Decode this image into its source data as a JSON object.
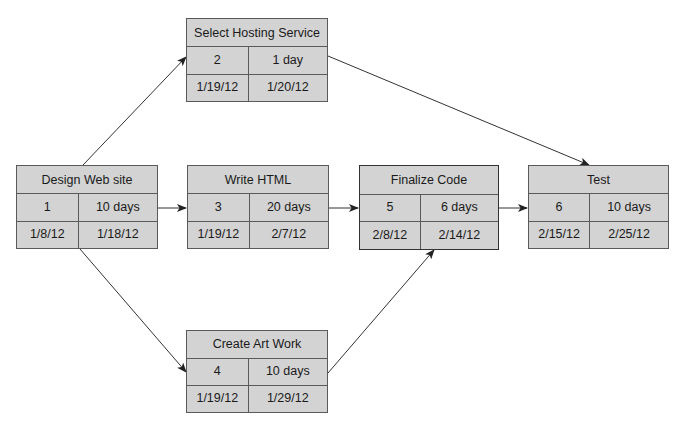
{
  "diagram": {
    "type": "activity-on-node network diagram",
    "colors": {
      "node_fill": "#d3d3d3",
      "node_border": "#5a5a5a",
      "edge": "#333333",
      "background": "#ffffff"
    },
    "nodes": [
      {
        "id": "n1",
        "name": "Design Web site",
        "number": "1",
        "duration": "10 days",
        "start": "1/8/12",
        "finish": "1/18/12",
        "box": {
          "x": 16,
          "y": 165,
          "w": 142,
          "h": 84
        }
      },
      {
        "id": "n2",
        "name": "Select Hosting Service",
        "number": "2",
        "duration": "1 day",
        "start": "1/19/12",
        "finish": "1/20/12",
        "box": {
          "x": 186,
          "y": 18,
          "w": 142,
          "h": 84
        }
      },
      {
        "id": "n3",
        "name": "Write HTML",
        "number": "3",
        "duration": "20 days",
        "start": "1/19/12",
        "finish": "2/7/12",
        "box": {
          "x": 187,
          "y": 165,
          "w": 142,
          "h": 84
        }
      },
      {
        "id": "n4",
        "name": "Create Art Work",
        "number": "4",
        "duration": "10 days",
        "start": "1/19/12",
        "finish": "1/29/12",
        "box": {
          "x": 186,
          "y": 330,
          "w": 142,
          "h": 83
        }
      },
      {
        "id": "n5",
        "name": "Finalize Code",
        "number": "5",
        "duration": "6 days",
        "start": "2/8/12",
        "finish": "2/14/12",
        "box": {
          "x": 359,
          "y": 165,
          "w": 140,
          "h": 85
        }
      },
      {
        "id": "n6",
        "name": "Test",
        "number": "6",
        "duration": "10 days",
        "start": "2/15/12",
        "finish": "2/25/12",
        "box": {
          "x": 528,
          "y": 165,
          "w": 141,
          "h": 84
        }
      }
    ],
    "edges": [
      {
        "from": "n1",
        "to": "n2",
        "x1": 83,
        "y1": 165,
        "x2": 186,
        "y2": 57
      },
      {
        "from": "n1",
        "to": "n3",
        "x1": 158,
        "y1": 208,
        "x2": 186,
        "y2": 208
      },
      {
        "from": "n1",
        "to": "n4",
        "x1": 80,
        "y1": 249,
        "x2": 186,
        "y2": 372
      },
      {
        "from": "n3",
        "to": "n5",
        "x1": 329,
        "y1": 208,
        "x2": 358,
        "y2": 208
      },
      {
        "from": "n2",
        "to": "n6",
        "x1": 328,
        "y1": 56,
        "x2": 589,
        "y2": 165
      },
      {
        "from": "n4",
        "to": "n5",
        "x1": 328,
        "y1": 373,
        "x2": 434,
        "y2": 250
      },
      {
        "from": "n5",
        "to": "n6",
        "x1": 499,
        "y1": 208,
        "x2": 527,
        "y2": 208
      }
    ]
  }
}
